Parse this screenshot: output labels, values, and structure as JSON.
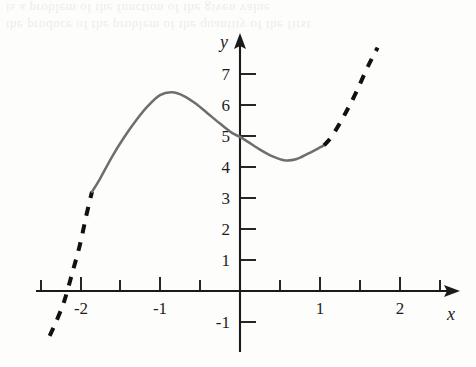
{
  "figure": {
    "background_color": "#fdfdfc",
    "scan_artifact_lines": [
      "the produce of the problem of the quantity of the first",
      "is a problem of the function of the given value"
    ]
  },
  "chart_data": {
    "type": "line",
    "title": "",
    "subtitle": "",
    "xlabel": "x",
    "ylabel": "y",
    "xlim": [
      -2.45,
      2.6
    ],
    "ylim": [
      -1.6,
      7.9
    ],
    "grid": false,
    "legend": null,
    "x_tick_labels": [
      "-2",
      "-1",
      "1",
      "2"
    ],
    "x_tick_values": [
      -2,
      -1,
      1,
      2
    ],
    "x_minor_tick_values": [
      -2.5,
      -1.5,
      -0.5,
      0.5,
      1.5,
      2.5
    ],
    "y_tick_labels": [
      "7",
      "6",
      "5",
      "4",
      "3",
      "2",
      "1",
      "-1"
    ],
    "y_tick_values": [
      7,
      6,
      5,
      4,
      3,
      2,
      1,
      -1
    ],
    "axis_color": "#1b1b1b",
    "series": [
      {
        "name": "curve-solid-segment",
        "style": "solid",
        "color": "#6e6e6e",
        "x": [
          -1.85,
          -1.75,
          -1.6,
          -1.45,
          -1.3,
          -1.15,
          -1.0,
          -0.85,
          -0.7,
          -0.55,
          -0.4,
          -0.25,
          -0.1,
          0.0,
          0.1,
          0.25,
          0.4,
          0.55,
          0.7,
          0.85,
          1.0,
          1.05
        ],
        "y": [
          3.2,
          3.62,
          4.33,
          4.95,
          5.5,
          5.97,
          6.32,
          6.41,
          6.29,
          6.04,
          5.72,
          5.4,
          5.1,
          4.97,
          4.81,
          4.56,
          4.35,
          4.22,
          4.25,
          4.43,
          4.63,
          4.7
        ]
      },
      {
        "name": "curve-dashed-left-extension",
        "style": "dashed",
        "color": "#111111",
        "x": [
          -2.38,
          -2.3,
          -2.2,
          -2.1,
          -2.0,
          -1.92,
          -1.85
        ],
        "y": [
          -1.45,
          -1.0,
          -0.35,
          0.55,
          1.5,
          2.45,
          3.2
        ]
      },
      {
        "name": "curve-dashed-right-extension",
        "style": "dashed",
        "color": "#111111",
        "x": [
          1.05,
          1.15,
          1.3,
          1.45,
          1.6,
          1.72
        ],
        "y": [
          4.7,
          5.0,
          5.65,
          6.4,
          7.25,
          7.85
        ]
      }
    ],
    "features": {
      "local_maximum": {
        "x": -1.0,
        "y": 6.4
      },
      "local_minimum": {
        "x": 0.55,
        "y": 4.2
      },
      "y_intercept": {
        "x": 0,
        "y": 5.0
      },
      "x_intercept_dashed": {
        "x": -2.17,
        "y": 0
      }
    },
    "annotations": []
  }
}
